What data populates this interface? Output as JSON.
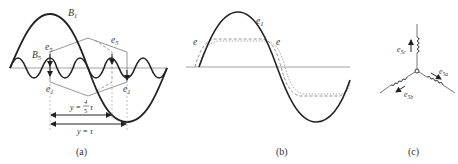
{
  "figure": {
    "panels": [
      {
        "id": "a",
        "caption": "(a)",
        "labels": {
          "B1": "B",
          "B1_sub": "1",
          "B5": "B",
          "B5_sub": "5",
          "e5_left": "e",
          "e5_left_sub": "5",
          "e5_right": "e",
          "e5_right_sub": "5",
          "e1_left": "e",
          "e1_left_sub": "1",
          "e1_right": "e",
          "e1_right_sub": "1",
          "y_short": "y = ",
          "y_short_frac_num": "4",
          "y_short_frac_den": "5",
          "y_short_tau": "τ",
          "y_long": "y = τ"
        }
      },
      {
        "id": "b",
        "caption": "(b)",
        "labels": {
          "e1": "e",
          "e1_sub": "1",
          "e_left": "e",
          "e_right": "e"
        }
      },
      {
        "id": "c",
        "caption": "(c)",
        "labels": {
          "e5c": "e",
          "e5c_sub": "5c",
          "e5a": "e",
          "e5a_sub": "5a",
          "e5b": "e",
          "e5b_sub": "5b"
        }
      }
    ],
    "colors": {
      "stroke_main": "#222222",
      "stroke_light": "#8a8a8a",
      "text": "#333333"
    }
  }
}
